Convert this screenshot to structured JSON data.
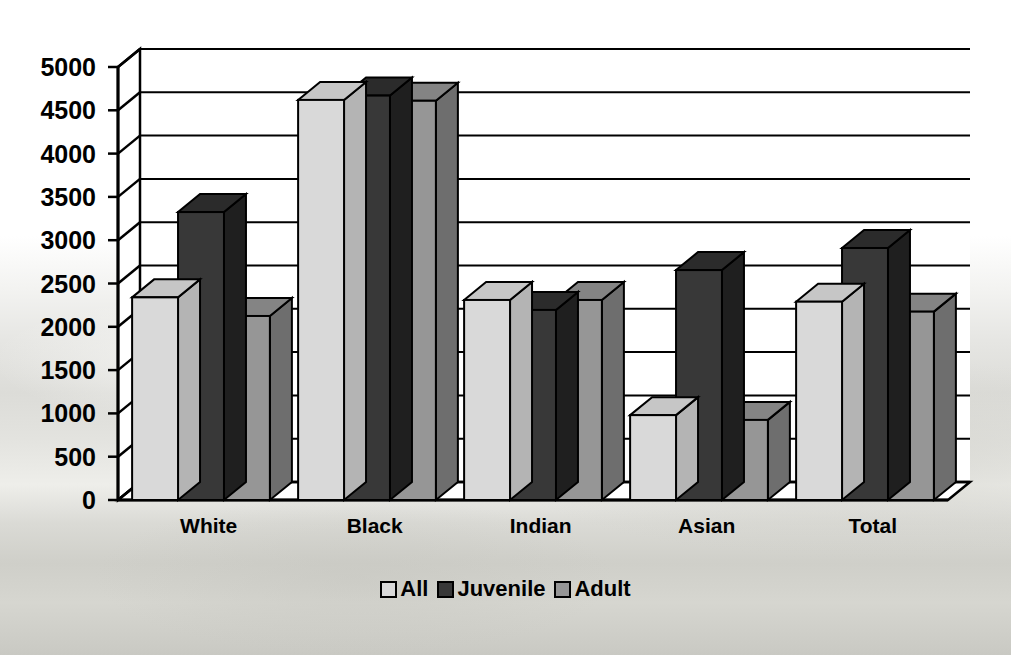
{
  "chart_data": {
    "type": "bar",
    "title": "",
    "xlabel": "",
    "ylabel": "",
    "ylim": [
      0,
      5000
    ],
    "ytick_step": 500,
    "yticks": [
      0,
      500,
      1000,
      1500,
      2000,
      2500,
      3000,
      3500,
      4000,
      4500,
      5000
    ],
    "ytick_labels": [
      "0",
      "500",
      "1000",
      "1500",
      "2000",
      "2500",
      "3000",
      "3500",
      "4000",
      "4500",
      "5000"
    ],
    "categories": [
      "White",
      "Black",
      "Indian",
      "Asian",
      "Total"
    ],
    "grid": true,
    "style": "3d-clustered-column",
    "legend_position": "bottom",
    "series": [
      {
        "name": "All",
        "color": "#d9d9d9",
        "side_color": "#b4b4b4",
        "top_color": "#c6c6c6",
        "values": [
          2340,
          4620,
          2310,
          980,
          2290
        ]
      },
      {
        "name": "Juvenile",
        "color": "#383838",
        "side_color": "#1f1f1f",
        "top_color": "#2b2b2b",
        "values": [
          3325,
          4670,
          2195,
          2655,
          2910
        ]
      },
      {
        "name": "Adult",
        "color": "#969696",
        "side_color": "#6e6e6e",
        "top_color": "#848484",
        "values": [
          2125,
          4610,
          2310,
          925,
          2175
        ]
      }
    ]
  },
  "legend": {
    "items": [
      {
        "label": "All",
        "swatch": "#d9d9d9"
      },
      {
        "label": "Juvenile",
        "swatch": "#383838"
      },
      {
        "label": "Adult",
        "swatch": "#969696"
      }
    ]
  },
  "colors": {
    "axis": "#000000",
    "grid": "#000000",
    "plot_background": "transparent",
    "text": "#000000"
  }
}
